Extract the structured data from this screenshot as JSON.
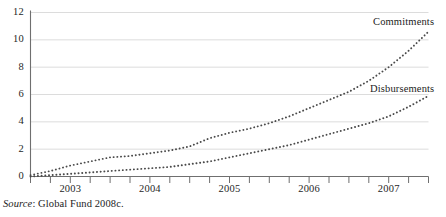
{
  "figure": {
    "source_note_prefix": "Source",
    "source_note_text": ": Global Fund 2008c.",
    "background_color": "#ffffff",
    "axis_color": "#6f6f6f",
    "gridline_color": "#d8d8d8",
    "series_color": "#4a4a4a"
  },
  "chart_data": {
    "type": "line",
    "title": "",
    "subtitle": "",
    "xlabel": "",
    "ylabel": "",
    "ylim": [
      0,
      12
    ],
    "yticks": [
      0,
      2,
      4,
      6,
      8,
      10,
      12
    ],
    "ytick_labels": [
      "0",
      "2",
      "4",
      "6",
      "8",
      "10",
      "12"
    ],
    "grid": true,
    "grid_axis": "y",
    "legend_position": "inline-right-of-series",
    "line_style": "dotted",
    "xtick_labels": [
      "2003",
      "2004",
      "2005",
      "2006",
      "2007"
    ],
    "x_tick_interval": "quarterly",
    "x_minor_ticks": 20,
    "x": [
      "2003Q1",
      "2003Q2",
      "2003Q3",
      "2003Q4",
      "2004Q1",
      "2004Q2",
      "2004Q3",
      "2004Q4",
      "2005Q1",
      "2005Q2",
      "2005Q3",
      "2005Q4",
      "2006Q1",
      "2006Q2",
      "2006Q3",
      "2006Q4",
      "2007Q1",
      "2007Q2",
      "2007Q3",
      "2007Q4",
      "2008Q1"
    ],
    "series": [
      {
        "name": "Commitments",
        "values": [
          0.1,
          0.4,
          0.8,
          1.1,
          1.4,
          1.5,
          1.7,
          1.9,
          2.2,
          2.8,
          3.2,
          3.5,
          3.9,
          4.4,
          5.0,
          5.6,
          6.2,
          7.0,
          8.0,
          9.2,
          10.6
        ]
      },
      {
        "name": "Disbursements",
        "values": [
          0.0,
          0.1,
          0.2,
          0.3,
          0.4,
          0.5,
          0.6,
          0.7,
          0.9,
          1.1,
          1.4,
          1.7,
          2.0,
          2.3,
          2.7,
          3.1,
          3.5,
          3.9,
          4.4,
          5.1,
          5.9
        ]
      }
    ],
    "annotations": [
      {
        "text": "Commitments",
        "x_px": 373,
        "y_px": 16
      },
      {
        "text": "Disbursements",
        "x_px": 370,
        "y_px": 83
      }
    ]
  }
}
